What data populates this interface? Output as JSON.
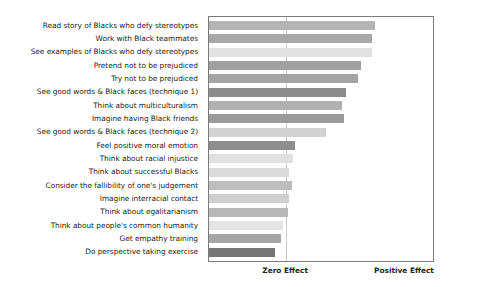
{
  "chart_data": {
    "type": "bar",
    "orientation": "horizontal",
    "title": "",
    "subtitle": "",
    "xlabel": "",
    "ylabel": "",
    "grid": false,
    "legend": null,
    "axis_captions": {
      "zero": "Zero Effect",
      "positive": "Positive Effect"
    },
    "axis_marker_values": {
      "zero": 0.0,
      "positive": 1.0
    },
    "xlim": [
      0,
      1.0
    ],
    "note": "Bars extend rightward from a common left origin; vertical reference line marks Zero Effect.",
    "categories": [
      "Read story of Blacks who defy stereotypes",
      "Work with Black teammates",
      "See examples of Blacks who defy stereotypes",
      "Pretend not to be prejudiced",
      "Try not to be prejudiced",
      "See good words & Black faces (technique 1)",
      "Think about multiculturalism",
      "Imagine having Black friends",
      "See good words & Black faces (technique 2)",
      "Feel positive moral emotion",
      "Think about racial injustice",
      "Think about successful Blacks",
      "Consider the fallibility of one's judgement",
      "Imagine interracial contact",
      "Think about egalitarianism",
      "Think about people's common humanity",
      "Get empathy training",
      "Do perspective taking exercise"
    ],
    "values": [
      0.766,
      0.752,
      0.752,
      0.699,
      0.686,
      0.633,
      0.611,
      0.624,
      0.54,
      0.398,
      0.385,
      0.367,
      0.381,
      0.367,
      0.363,
      0.341,
      0.332,
      0.305
    ],
    "bar_colors": [
      "#b4b4b4",
      "#a8a8a8",
      "#e2e2e2",
      "#a0a0a0",
      "#a4a4a4",
      "#8c8c8c",
      "#b0b0b0",
      "#9a9a9a",
      "#d2d2d2",
      "#8e8e8e",
      "#e0e0e0",
      "#dadada",
      "#bdbdbd",
      "#cfcfcf",
      "#b8b8b8",
      "#e4e4e4",
      "#a6a6a6",
      "#767676"
    ]
  }
}
